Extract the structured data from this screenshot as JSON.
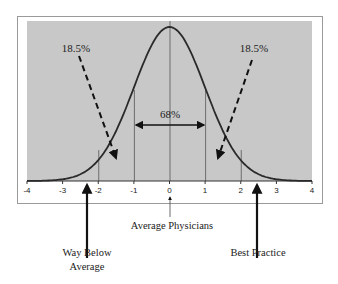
{
  "chart_data": {
    "type": "line",
    "title": "",
    "xlabel": "",
    "ylabel": "",
    "xlim": [
      -4,
      4
    ],
    "x_ticks": [
      "-4",
      "-3",
      "-2",
      "-1",
      "0",
      "1",
      "2",
      "3",
      "4"
    ],
    "gridlines_x": [
      -2,
      -1,
      0,
      1,
      2
    ],
    "series": [
      {
        "name": "Normal distribution (bell curve)",
        "x": [
          -4,
          -3.5,
          -3,
          -2.5,
          -2,
          -1.5,
          -1,
          -0.5,
          0,
          0.5,
          1,
          1.5,
          2,
          2.5,
          3,
          3.5,
          4
        ],
        "values": [
          0.0001,
          0.0009,
          0.0044,
          0.0175,
          0.054,
          0.1295,
          0.242,
          0.3521,
          0.3989,
          0.3521,
          0.242,
          0.1295,
          0.054,
          0.0175,
          0.0044,
          0.0009,
          0.0001
        ]
      }
    ],
    "annotations": [
      {
        "text": "18.5%",
        "position": "upper-left",
        "arrow": "dashed, pointing to left tail near x=-1.5"
      },
      {
        "text": "18.5%",
        "position": "upper-right",
        "arrow": "dashed, pointing to right tail near x=1.5"
      },
      {
        "text": "68%",
        "position": "center",
        "arrow": "double-headed from x=-1 to x=1"
      },
      {
        "text": "Average Physicians",
        "points_to_x": 0
      },
      {
        "text": "Way Below Average",
        "points_to_x": -2.5
      },
      {
        "text": "Best Practice",
        "points_to_x": 2.5
      }
    ],
    "grid": true,
    "legend": "none"
  },
  "labels": {
    "left_pct": "18.5%",
    "right_pct": "18.5%",
    "center_pct": "68%",
    "average": "Average Physicians",
    "way_below_line1": "Way Below",
    "way_below_line2": "Average",
    "best_practice": "Best Practice"
  },
  "colors": {
    "plot_bg": "#c8c8c8",
    "frame": "#9a9a9a",
    "curve": "#2a2a2a",
    "text": "#222222"
  }
}
